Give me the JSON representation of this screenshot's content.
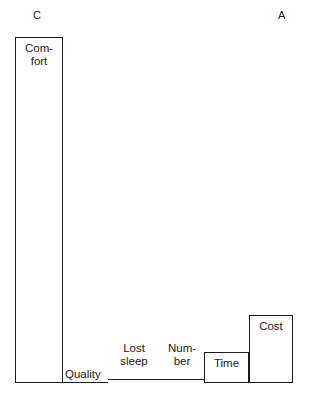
{
  "figure": {
    "axis_left_label": "C",
    "axis_right_label": "A",
    "background_color": "#ffffff",
    "stroke_color": "#1a1a1a"
  },
  "chart_data": {
    "type": "bar",
    "title": "",
    "subtitle": "",
    "xlabel": "",
    "ylabel": "",
    "grid": false,
    "legend": "none",
    "axis_annotations": {
      "left": "C",
      "right": "A"
    },
    "note": "Variable-width (mekko) bar chart. Bar widths differ; heights encode relative importance, sorted descending left to right.",
    "categories": [
      "Comfort",
      "Quality",
      "Lost sleep",
      "Number",
      "Time",
      "Cost"
    ],
    "values": [
      346,
      0,
      4,
      4,
      31,
      68
    ],
    "ylim": [
      0,
      346
    ],
    "bars": [
      {
        "label": "Comfort",
        "label_text": "Com-\nfort",
        "x": 15,
        "width": 48,
        "top": 37,
        "height": 346,
        "flat": false,
        "label_x": 19,
        "label_y": 42,
        "label_width": 40,
        "label_align": "center"
      },
      {
        "label": "Quality",
        "label_text": "Quality",
        "x": 63,
        "width": 45,
        "top": 382,
        "height": 1,
        "flat": true,
        "label_x": 65,
        "label_y": 368,
        "label_width": 44,
        "label_align": "left"
      },
      {
        "label": "Lost sleep",
        "label_text": "Lost\nsleep",
        "x": 108,
        "width": 52,
        "top": 379,
        "height": 4,
        "flat": true,
        "label_x": 110,
        "label_y": 342,
        "label_width": 48,
        "label_align": "center"
      },
      {
        "label": "Number",
        "label_text": "Num-\nber",
        "x": 160,
        "width": 44,
        "top": 379,
        "height": 4,
        "flat": true,
        "label_x": 159,
        "label_y": 342,
        "label_width": 46,
        "label_align": "center"
      },
      {
        "label": "Time",
        "label_text": "Time",
        "x": 204,
        "width": 45,
        "top": 352,
        "height": 31,
        "flat": false,
        "label_x": 206,
        "label_y": 357,
        "label_width": 41,
        "label_align": "center"
      },
      {
        "label": "Cost",
        "label_text": "Cost",
        "x": 249,
        "width": 44,
        "top": 315,
        "height": 68,
        "flat": false,
        "label_x": 251,
        "label_y": 320,
        "label_width": 40,
        "label_align": "center"
      }
    ]
  },
  "axis_positions": {
    "left_label_x": 33,
    "left_label_y": 10,
    "right_label_x": 278,
    "right_label_y": 10
  }
}
